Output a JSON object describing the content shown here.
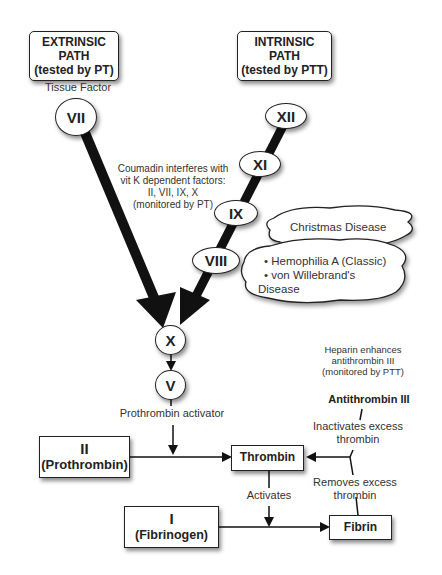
{
  "extrinsic": {
    "title_line1": "EXTRINSIC",
    "title_line2": "PATH",
    "title_line3": "(tested by PT)",
    "tissue_factor_label": "Tissue Factor",
    "factors": [
      "VII"
    ]
  },
  "intrinsic": {
    "title_line1": "INTRINSIC",
    "title_line2": "PATH",
    "title_line3": "(tested by PTT)",
    "factors": [
      "XII",
      "XI",
      "IX",
      "VIII"
    ]
  },
  "coumadin_note": {
    "line1": "Coumadin interferes with",
    "line2": "vit K dependent factors:",
    "line3": "II, VII, IX, X",
    "line4": "(monitored by PT)"
  },
  "diseases": {
    "christmas": "Christmas Disease",
    "hemophilia_line1": "• Hemophilia A (Classic)",
    "hemophilia_line2": "• von Willebrand's",
    "hemophilia_line3": "Disease"
  },
  "common": {
    "factor_x": "X",
    "factor_v": "V",
    "prothrombin_activator": "Prothrombin activator",
    "prothrombin_numeral": "II",
    "prothrombin_name": "(Prothrombin)",
    "thrombin": "Thrombin",
    "activates": "Activates",
    "fibrinogen_numeral": "I",
    "fibrinogen_name": "(Fibrinogen)",
    "fibrin": "Fibrin"
  },
  "heparin_note": {
    "line1": "Heparin enhances",
    "line2": "antithrombin III",
    "line3": "(monitored by PTT)"
  },
  "antithrombin": {
    "title": "Antithrombin III",
    "inactivates_line1": "Inactivates excess",
    "inactivates_line2": "thrombin",
    "removes_line1": "Removes excess",
    "removes_line2": "thrombin"
  }
}
